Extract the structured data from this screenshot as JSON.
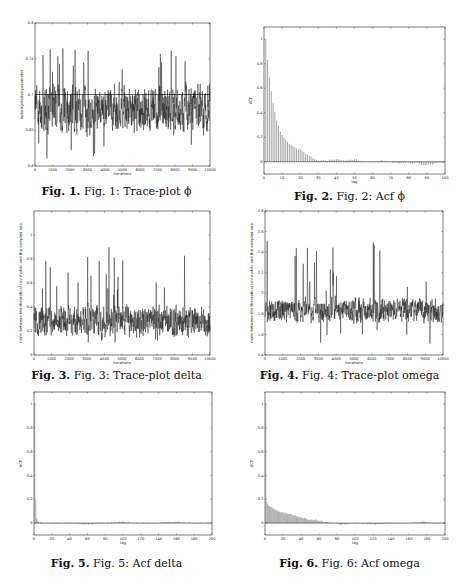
{
  "figures": [
    {
      "id": "fig1",
      "label": "Fig. 1.",
      "text": "Fig. 1: Trace-plot ϕ"
    },
    {
      "id": "fig2",
      "label": "Fig. 2.",
      "text": "Fig. 2: Acf ϕ"
    },
    {
      "id": "fig3",
      "label": "Fig. 3.",
      "text": "Fig. 3: Trace-plot delta"
    },
    {
      "id": "fig4",
      "label": "Fig. 4.",
      "text": "Fig. 4: Trace-plot omega"
    },
    {
      "id": "fig5",
      "label": "Fig. 5.",
      "text": "Fig. 5: Acf delta"
    },
    {
      "id": "fig6",
      "label": "Fig. 6.",
      "text": "Fig. 6: Acf omega"
    }
  ],
  "chart_data": [
    {
      "id": "fig1",
      "type": "line",
      "title": "Fig. 1: Trace-plot ϕ",
      "xlabel": "iterations",
      "ylabel": "autoregressive parameter",
      "xlim": [
        0,
        10000
      ],
      "ylim": [
        0.6,
        0.8
      ],
      "xticks": [
        0,
        1000,
        2000,
        3000,
        4000,
        5000,
        6000,
        7000,
        8000,
        9000,
        10000
      ],
      "yticks": [
        0.6,
        0.65,
        0.7,
        0.75,
        0.8
      ],
      "ytick_labels": [
        "0.6",
        "0.65",
        "0.7",
        "0.75",
        "0.8"
      ],
      "series": {
        "center": 0.68,
        "spread": 0.025,
        "min": 0.61,
        "max": 0.765,
        "n": 10000
      },
      "hline": 0.7,
      "grid": false
    },
    {
      "id": "fig2",
      "type": "bar",
      "title": "Fig. 2: Acf ϕ",
      "xlabel": "lag",
      "ylabel": "ACF",
      "xlim": [
        0,
        100
      ],
      "ylim": [
        -0.1,
        1.1
      ],
      "xticks": [
        0,
        10,
        20,
        30,
        40,
        50,
        60,
        70,
        80,
        90,
        100
      ],
      "yticks": [
        0,
        0.2,
        0.4,
        0.6,
        0.8,
        1
      ],
      "ytick_labels": [
        "0",
        "0.2",
        "0.4",
        "0.6",
        "0.8",
        "1"
      ],
      "lags": [
        1,
        2,
        3,
        4,
        5,
        6,
        7,
        8,
        9,
        10,
        12,
        14,
        16,
        18,
        20,
        22,
        24,
        26,
        28,
        30,
        35,
        40,
        45,
        50,
        55,
        60,
        65,
        70,
        75,
        80,
        85,
        88,
        90,
        95
      ],
      "values": [
        1.0,
        0.83,
        0.69,
        0.58,
        0.48,
        0.41,
        0.34,
        0.29,
        0.25,
        0.22,
        0.18,
        0.15,
        0.13,
        0.11,
        0.1,
        0.08,
        0.06,
        0.04,
        0.02,
        0.01,
        0.01,
        0.02,
        0.01,
        0.02,
        0.0,
        0.0,
        0.01,
        0.0,
        -0.01,
        -0.01,
        -0.01,
        -0.03,
        -0.03,
        -0.01
      ],
      "grid": false
    },
    {
      "id": "fig3",
      "type": "line",
      "title": "Fig. 3: Trace-plot delta",
      "xlabel": "iterations",
      "ylabel": "norm between the theoretical cov matrix and the sampled one",
      "xlim": [
        0,
        10000
      ],
      "ylim": [
        0,
        1.2
      ],
      "xticks": [
        0,
        1000,
        2000,
        3000,
        4000,
        5000,
        6000,
        7000,
        8000,
        9000,
        10000
      ],
      "yticks": [
        0,
        0.2,
        0.4,
        0.6,
        0.8,
        1
      ],
      "ytick_labels": [
        "0",
        "0.2",
        "0.4",
        "0.6",
        "0.8",
        "1"
      ],
      "series": {
        "center": 0.28,
        "spread": 0.1,
        "min": 0.1,
        "max": 0.99,
        "n": 10000
      },
      "grid": false
    },
    {
      "id": "fig4",
      "type": "line",
      "title": "Fig. 4: Trace-plot omega",
      "xlabel": "iterations",
      "ylabel": "norm between the theoretical cov matrix and the sampled one",
      "xlim": [
        0,
        10000
      ],
      "ylim": [
        1.4,
        2.8
      ],
      "xticks": [
        0,
        1000,
        2000,
        3000,
        4000,
        5000,
        6000,
        7000,
        8000,
        9000,
        10000
      ],
      "yticks": [
        1.4,
        1.6,
        1.8,
        2,
        2.2,
        2.4,
        2.6,
        2.8
      ],
      "ytick_labels": [
        "1.4",
        "1.6",
        "1.8",
        "2",
        "2.2",
        "2.4",
        "2.6",
        "2.8"
      ],
      "series": {
        "center": 1.83,
        "spread": 0.09,
        "min": 1.5,
        "max": 2.52,
        "n": 10000
      },
      "grid": false
    },
    {
      "id": "fig5",
      "type": "bar",
      "title": "Fig. 5: Acf delta",
      "xlabel": "lag",
      "ylabel": "ACF",
      "xlim": [
        0,
        200
      ],
      "ylim": [
        -0.1,
        1.1
      ],
      "xticks": [
        0,
        20,
        40,
        60,
        80,
        100,
        120,
        140,
        160,
        180,
        200
      ],
      "yticks": [
        0,
        0.2,
        0.4,
        0.6,
        0.8,
        1
      ],
      "ytick_labels": [
        "0",
        "0.2",
        "0.4",
        "0.6",
        "0.8",
        "1"
      ],
      "lags": [
        1,
        2,
        3,
        4,
        5,
        10,
        20,
        40,
        60,
        80,
        100,
        120,
        140,
        160,
        180,
        200
      ],
      "values": [
        1.0,
        0.19,
        0.04,
        0.02,
        0.01,
        0.0,
        0.0,
        0.0,
        -0.01,
        0.0,
        0.01,
        0.0,
        0.0,
        0.01,
        0.0,
        0.0
      ],
      "grid": false
    },
    {
      "id": "fig6",
      "type": "bar",
      "title": "Fig. 6: Acf omega",
      "xlabel": "lag",
      "ylabel": "ACF",
      "xlim": [
        0,
        200
      ],
      "ylim": [
        -0.1,
        1.1
      ],
      "xticks": [
        0,
        20,
        40,
        60,
        80,
        100,
        120,
        140,
        160,
        180,
        200
      ],
      "yticks": [
        0,
        0.2,
        0.4,
        0.6,
        0.8,
        1
      ],
      "ytick_labels": [
        "0",
        "0.2",
        "0.4",
        "0.6",
        "0.8",
        "1"
      ],
      "lags": [
        1,
        2,
        3,
        5,
        10,
        15,
        20,
        25,
        30,
        35,
        40,
        45,
        50,
        55,
        60,
        65,
        70,
        80,
        90,
        100,
        120,
        140,
        160,
        175,
        190,
        200
      ],
      "values": [
        1.0,
        0.18,
        0.16,
        0.14,
        0.12,
        0.1,
        0.09,
        0.08,
        0.07,
        0.06,
        0.05,
        0.04,
        0.03,
        0.03,
        0.02,
        0.01,
        0.01,
        -0.01,
        -0.01,
        0.0,
        -0.01,
        0.0,
        0.0,
        0.01,
        0.0,
        0.0
      ],
      "grid": false
    }
  ]
}
